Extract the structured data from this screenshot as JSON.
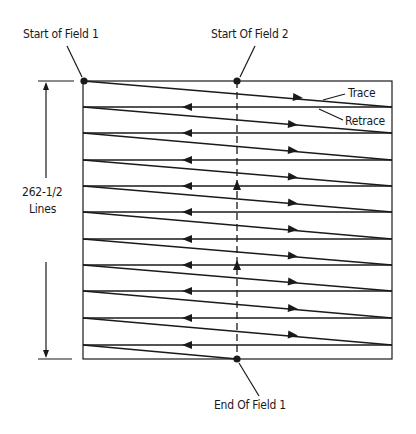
{
  "diagram": {
    "type": "interlaced-scan-field",
    "labels": {
      "start_field_1": "Start of Field 1",
      "start_field_2": "Start Of Field 2",
      "end_field_1": "End Of Field 1",
      "trace": "Trace",
      "retrace": "Retrace",
      "line_count_value": "262-1/2",
      "line_count_unit": "Lines"
    },
    "box": {
      "left": 83,
      "top": 81,
      "right": 392,
      "bottom": 359
    },
    "center_dashed_x": 237,
    "retrace_rows_y": [
      107,
      133,
      160,
      186,
      212,
      239,
      265,
      291,
      318,
      345
    ],
    "colors": {
      "stroke": "#1a1a1a",
      "background": "#ffffff"
    }
  }
}
